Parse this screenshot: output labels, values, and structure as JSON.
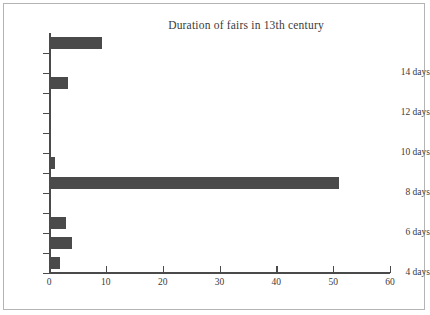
{
  "chart_data": {
    "type": "bar",
    "orientation": "horizontal",
    "title": "Duration of fairs in 13th century",
    "xlabel": "",
    "ylabel": "",
    "categories": [
      "4 days",
      "5 days",
      "6 days",
      "7 days",
      "8 days",
      "9 days",
      "10 days",
      "11 days",
      "12 days",
      "13 days",
      "14 days",
      "15 days"
    ],
    "values": [
      2,
      4,
      3,
      0,
      51,
      1,
      0,
      0,
      0,
      3.3,
      0,
      9.3
    ],
    "xlim": [
      0,
      60
    ],
    "xticks": [
      0,
      10,
      20,
      30,
      40,
      50,
      60
    ],
    "xtick_labels": [
      "0",
      "10",
      "20",
      "30",
      "40",
      "50",
      "60"
    ],
    "yticks": [
      "4 days",
      "6 days",
      "8 days",
      "10 days",
      "12 days",
      "14 days"
    ],
    "grid": false,
    "legend": null,
    "bar_color": "#4a4a4a",
    "background_color": "#ffffff",
    "border_color": "#b4b4b4"
  }
}
